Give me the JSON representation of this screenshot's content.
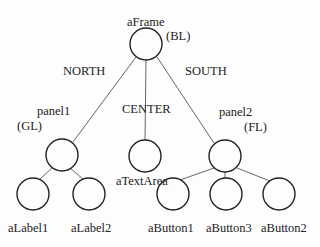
{
  "diagram": {
    "nodes": [
      {
        "id": "aFrame",
        "label": "aFrame",
        "layout": "(BL)",
        "cx": 146,
        "cy": 44
      },
      {
        "id": "panel1",
        "label": "panel1",
        "layout": "(GL)",
        "cx": 62,
        "cy": 154
      },
      {
        "id": "aTextArea",
        "label": "aTextArea",
        "layout": "",
        "cx": 145,
        "cy": 156
      },
      {
        "id": "panel2",
        "label": "panel2",
        "layout": "(FL)",
        "cx": 225,
        "cy": 156
      },
      {
        "id": "aLabel1",
        "label": "aLabel1",
        "layout": "",
        "cx": 33,
        "cy": 194
      },
      {
        "id": "aLabel2",
        "label": "aLabel2",
        "layout": "",
        "cx": 89,
        "cy": 194
      },
      {
        "id": "aButton1",
        "label": "aButton1",
        "layout": "",
        "cx": 173,
        "cy": 194
      },
      {
        "id": "aButton3",
        "label": "aButton3",
        "layout": "",
        "cx": 226,
        "cy": 194
      },
      {
        "id": "aButton2",
        "label": "aButton2",
        "layout": "",
        "cx": 279,
        "cy": 194
      }
    ],
    "edges": [
      {
        "from": "aFrame",
        "to": "panel1",
        "label": "NORTH"
      },
      {
        "from": "aFrame",
        "to": "aTextArea",
        "label": "CENTER"
      },
      {
        "from": "aFrame",
        "to": "panel2",
        "label": "SOUTH"
      },
      {
        "from": "panel1",
        "to": "aLabel1",
        "label": ""
      },
      {
        "from": "panel1",
        "to": "aLabel2",
        "label": ""
      },
      {
        "from": "panel2",
        "to": "aButton1",
        "label": ""
      },
      {
        "from": "panel2",
        "to": "aButton3",
        "label": ""
      },
      {
        "from": "panel2",
        "to": "aButton2",
        "label": ""
      }
    ],
    "labels": {
      "aFrame": "aFrame",
      "aFrame_layout": "(BL)",
      "north": "NORTH",
      "south": "SOUTH",
      "center": "CENTER",
      "panel1": "panel1",
      "panel1_layout": "(GL)",
      "panel2": "panel2",
      "panel2_layout": "(FL)",
      "aTextArea": "aTextArea",
      "aLabel1": "aLabel1",
      "aLabel2": "aLabel2",
      "aButton1": "aButton1",
      "aButton3": "aButton3",
      "aButton2": "aButton2"
    },
    "colors": {
      "stroke": "#222222",
      "edge": "#555555",
      "background": "#fdfdfd"
    }
  }
}
